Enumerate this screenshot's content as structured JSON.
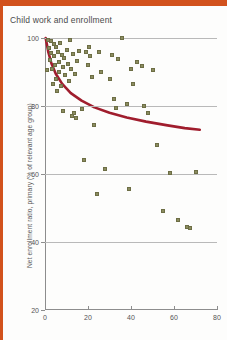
{
  "page": {
    "background": "#fdfdfc",
    "accent_band_color": "#d2521d"
  },
  "title": "Child work and enrollment",
  "chart_data": {
    "type": "scatter",
    "title": "Child work and enrollment",
    "xlabel": "",
    "ylabel": "Net enrollment ratio, primary (% of relevant age group)",
    "xlim": [
      0,
      80
    ],
    "ylim": [
      20,
      100
    ],
    "xticks": [
      0,
      20,
      40,
      60,
      80
    ],
    "yticks": [
      20,
      40,
      60,
      80,
      100
    ],
    "gridlines_y": [
      40,
      60,
      80,
      100
    ],
    "grid": true,
    "legend": "none",
    "marker_color": "#8b8c5f",
    "marker_edge_color": "#6d6e45",
    "trend_color": "#a01d2d",
    "series": [
      {
        "name": "countries",
        "points": [
          [
            1.0,
            90.5
          ],
          [
            1.5,
            99.3
          ],
          [
            2.0,
            97.0
          ],
          [
            2.3,
            93.5
          ],
          [
            2.8,
            99.0
          ],
          [
            3.0,
            95.5
          ],
          [
            3.2,
            91.0
          ],
          [
            3.6,
            86.5
          ],
          [
            4.0,
            98.2
          ],
          [
            4.2,
            94.6
          ],
          [
            4.6,
            92.0
          ],
          [
            5.0,
            97.4
          ],
          [
            5.2,
            88.0
          ],
          [
            5.5,
            84.5
          ],
          [
            6.0,
            96.0
          ],
          [
            6.3,
            93.0
          ],
          [
            6.6,
            90.0
          ],
          [
            7.0,
            98.5
          ],
          [
            7.4,
            86.0
          ],
          [
            7.8,
            95.0
          ],
          [
            8.2,
            91.5
          ],
          [
            8.6,
            78.5
          ],
          [
            9.0,
            94.0
          ],
          [
            9.5,
            89.0
          ],
          [
            10.0,
            96.5
          ],
          [
            10.5,
            92.5
          ],
          [
            11.0,
            87.5
          ],
          [
            11.5,
            99.5
          ],
          [
            12.0,
            90.8
          ],
          [
            12.5,
            77.0
          ],
          [
            13.0,
            95.2
          ],
          [
            13.5,
            78.0
          ],
          [
            14.0,
            89.5
          ],
          [
            14.5,
            76.5
          ],
          [
            15.0,
            93.2
          ],
          [
            16.0,
            96.2
          ],
          [
            17.0,
            79.0
          ],
          [
            18.0,
            64.0
          ],
          [
            19.0,
            95.8
          ],
          [
            20.0,
            92.2
          ],
          [
            20.5,
            97.5
          ],
          [
            21.0,
            94.8
          ],
          [
            22.0,
            88.5
          ],
          [
            23.0,
            74.5
          ],
          [
            24.0,
            54.0
          ],
          [
            25.0,
            96.0
          ],
          [
            26.0,
            90.0
          ],
          [
            28.0,
            61.5
          ],
          [
            30.0,
            88.0
          ],
          [
            31.0,
            95.0
          ],
          [
            32.0,
            82.0
          ],
          [
            33.0,
            79.5
          ],
          [
            34.0,
            93.8
          ],
          [
            36.0,
            100.0
          ],
          [
            38.0,
            80.5
          ],
          [
            39.0,
            55.5
          ],
          [
            40.0,
            91.0
          ],
          [
            41.0,
            86.5
          ],
          [
            43.0,
            93.0
          ],
          [
            45.0,
            91.8
          ],
          [
            46.0,
            80.0
          ],
          [
            48.0,
            78.0
          ],
          [
            50.0,
            90.5
          ],
          [
            52.0,
            68.5
          ],
          [
            55.0,
            49.0
          ],
          [
            58.0,
            60.2
          ],
          [
            62.0,
            46.5
          ],
          [
            66.0,
            44.5
          ],
          [
            67.5,
            44.0
          ],
          [
            70.0,
            60.5
          ]
        ]
      }
    ],
    "trendline": {
      "description": "declining fitted curve",
      "points": [
        [
          0.3,
          100.0
        ],
        [
          1.5,
          96.0
        ],
        [
          3.0,
          92.5
        ],
        [
          5.0,
          89.5
        ],
        [
          8.0,
          86.5
        ],
        [
          12.0,
          83.8
        ],
        [
          17.0,
          81.6
        ],
        [
          23.0,
          79.6
        ],
        [
          30.0,
          78.0
        ],
        [
          38.0,
          76.6
        ],
        [
          47.0,
          75.4
        ],
        [
          57.0,
          74.3
        ],
        [
          65.0,
          73.5
        ],
        [
          72.0,
          73.0
        ]
      ]
    }
  }
}
